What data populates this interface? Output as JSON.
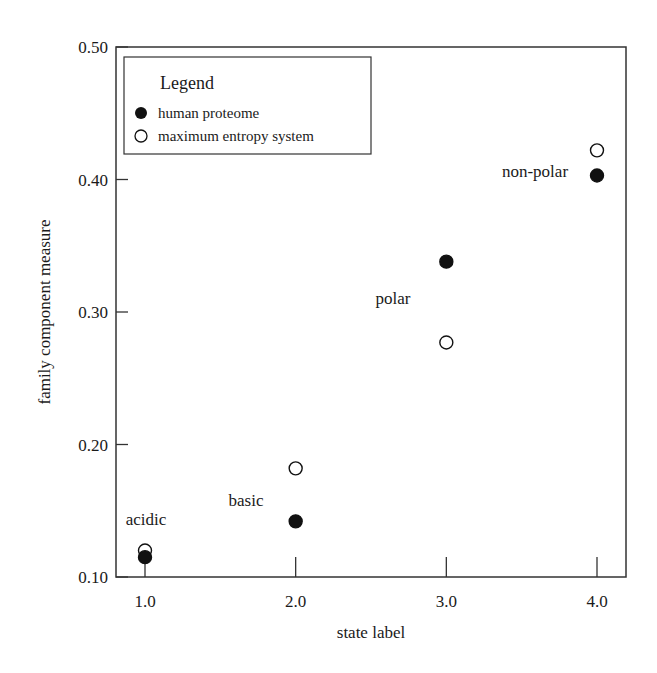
{
  "chart_data": {
    "type": "scatter",
    "title": "",
    "xlabel": "state label",
    "ylabel": "family component measure",
    "xlim": [
      0.8,
      4.2
    ],
    "ylim": [
      0.1,
      0.5
    ],
    "x_ticks": [
      1.0,
      2.0,
      3.0,
      4.0
    ],
    "x_tick_labels": [
      "1.0",
      "2.0",
      "3.0",
      "4.0"
    ],
    "y_ticks": [
      0.1,
      0.2,
      0.3,
      0.4,
      0.5
    ],
    "y_tick_labels": [
      "0.10",
      "0.20",
      "0.30",
      "0.40",
      "0.50"
    ],
    "grid": false,
    "legend": {
      "title": "Legend",
      "position": "upper left",
      "entries": [
        "human proteome",
        "maximum entropy system"
      ]
    },
    "series": [
      {
        "name": "human proteome",
        "marker": "filled-circle",
        "color": "#111111",
        "x": [
          1.0,
          2.0,
          3.0,
          4.0
        ],
        "y": [
          0.115,
          0.142,
          0.338,
          0.403
        ]
      },
      {
        "name": "maximum entropy system",
        "marker": "open-circle",
        "color": "#111111",
        "x": [
          1.0,
          2.0,
          3.0,
          4.0
        ],
        "y": [
          0.12,
          0.182,
          0.277,
          0.422
        ]
      }
    ],
    "annotations": [
      {
        "text": "acidic",
        "x": 1.0,
        "y": 0.15
      },
      {
        "text": "basic",
        "x": 2.0,
        "y": 0.17
      },
      {
        "text": "polar",
        "x": 3.0,
        "y": 0.31
      },
      {
        "text": "non-polar",
        "x": 4.0,
        "y": 0.405
      }
    ]
  }
}
